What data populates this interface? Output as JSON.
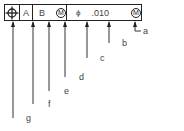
{
  "diagram": {
    "type": "feature-control-frame",
    "frame": {
      "symbol": "position",
      "datum_primary": "A",
      "datum_secondary": "B",
      "datum_secondary_modifier": "M",
      "diameter_symbol": "ϕ",
      "tolerance": ".010",
      "tolerance_modifier": "M"
    },
    "callouts": [
      {
        "label": "a",
        "target": "tolerance-modifier"
      },
      {
        "label": "b",
        "target": "tolerance-value"
      },
      {
        "label": "c",
        "target": "diameter-symbol"
      },
      {
        "label": "d",
        "target": "datum-modifier"
      },
      {
        "label": "e",
        "target": "secondary-datum"
      },
      {
        "label": "f",
        "target": "primary-datum"
      },
      {
        "label": "g",
        "target": "geometric-symbol"
      }
    ],
    "colors": {
      "line": "#222222",
      "text": "#444444",
      "background": "#ffffff"
    }
  }
}
